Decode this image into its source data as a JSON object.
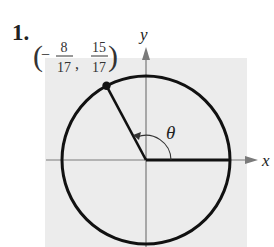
{
  "problem": {
    "number": "1.",
    "point_label": {
      "open": "(",
      "x_sign": "−",
      "x_num": "8",
      "x_den": "17",
      "comma": ",",
      "y_num": "15",
      "y_den": "17",
      "close": ")"
    },
    "axis_x_label": "x",
    "axis_y_label": "y",
    "angle_label": "θ"
  },
  "colors": {
    "background_panel": "#ececec",
    "curve": "#111111",
    "axis": "#7a7a7a"
  }
}
